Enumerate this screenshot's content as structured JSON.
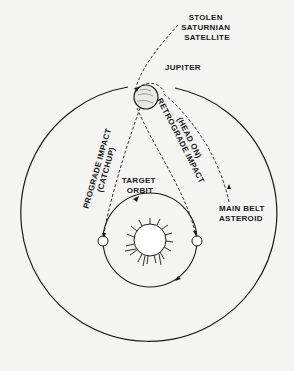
{
  "diagram": {
    "labels": {
      "stolen_satellite": [
        "STOLEN",
        "SATURNIAN",
        "SATELLITE"
      ],
      "jupiter": "JUPITER",
      "prograde": [
        "PROGRADE IMPACT",
        "(CATCHUP)"
      ],
      "retrograde": [
        "RETROGRADE IMPACT",
        "(HEAD ON)"
      ],
      "target_orbit": [
        "TARGET",
        "ORBIT"
      ],
      "main_belt": [
        "MAIN BELT",
        "ASTEROID"
      ]
    },
    "colors": {
      "ink": "#1a1a1a",
      "background": "#f4f4f2"
    }
  }
}
